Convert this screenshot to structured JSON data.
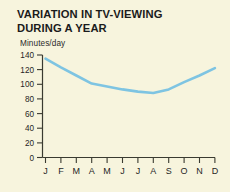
{
  "chart_data": {
    "type": "line",
    "title": "VARIATION IN TV-VIEWING DURING A YEAR",
    "ylabel": "Minutes/day",
    "xlabel": "",
    "categories": [
      "J",
      "F",
      "M",
      "A",
      "M",
      "J",
      "J",
      "A",
      "S",
      "O",
      "N",
      "D"
    ],
    "values": [
      135,
      123,
      112,
      101,
      97,
      93,
      90,
      88,
      93,
      103,
      112,
      122
    ],
    "series": [
      {
        "name": "Minutes/day",
        "values": [
          135,
          123,
          112,
          101,
          97,
          93,
          90,
          88,
          93,
          103,
          112,
          122
        ]
      }
    ],
    "yticks": [
      0,
      20,
      40,
      60,
      80,
      100,
      120,
      140
    ],
    "ylim": [
      0,
      140
    ],
    "grid": false,
    "legend": "none",
    "line_color": "#7ec4e2",
    "background_color": "#f7f4dd",
    "axis_color": "#3a3a30"
  }
}
